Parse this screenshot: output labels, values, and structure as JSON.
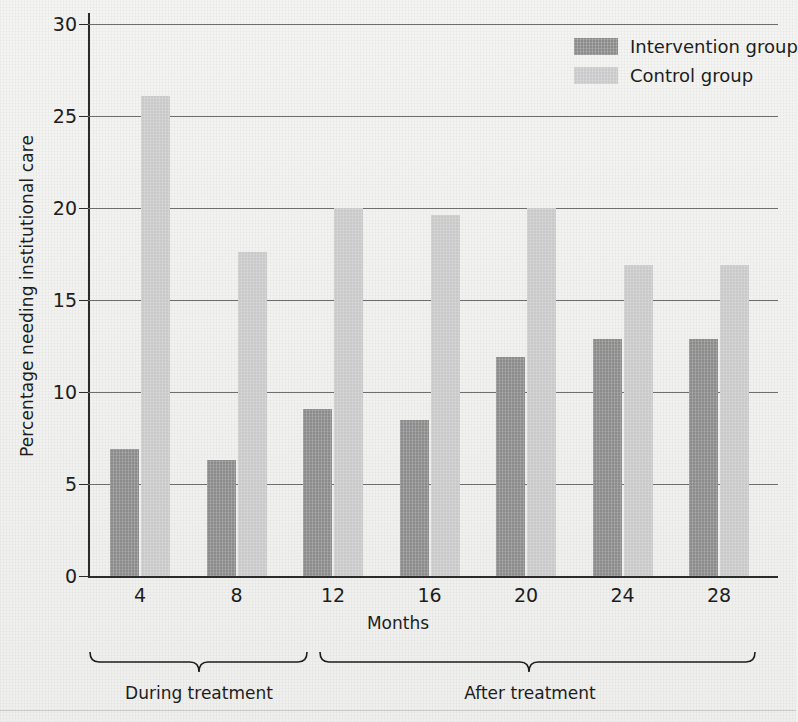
{
  "chart_data": {
    "type": "bar",
    "title": "",
    "xlabel": "Months",
    "ylabel": "Percentage needing institutional care",
    "categories": [
      "4",
      "8",
      "12",
      "16",
      "20",
      "24",
      "28"
    ],
    "ylim": [
      0,
      30
    ],
    "yticks": [
      0,
      5,
      10,
      15,
      20,
      25,
      30
    ],
    "grid": true,
    "legend_position": "top-right",
    "series": [
      {
        "name": "Intervention group",
        "color": "#8b8b8b",
        "values": [
          6.9,
          6.3,
          9.1,
          8.5,
          11.9,
          12.9,
          12.9
        ]
      },
      {
        "name": "Control group",
        "color": "#c9c9c9",
        "values": [
          26.1,
          17.6,
          20.0,
          19.6,
          20.0,
          16.9,
          16.9
        ]
      }
    ],
    "annotations": [
      {
        "label": "During treatment",
        "covers": [
          "4",
          "8",
          "12"
        ]
      },
      {
        "label": "After treatment",
        "covers": [
          "16",
          "20",
          "24",
          "28"
        ]
      }
    ]
  },
  "legend": {
    "items": [
      {
        "label": "Intervention group",
        "swatch": "intervention-swatch"
      },
      {
        "label": "Control group",
        "swatch": "control-swatch"
      }
    ]
  },
  "axes": {
    "y_title": "Percentage needing institutional care",
    "x_title": "Months",
    "y_ticks": [
      "30",
      "25",
      "20",
      "15",
      "10",
      "5",
      "0"
    ],
    "x_ticks": [
      "4",
      "8",
      "12",
      "16",
      "20",
      "24",
      "28"
    ]
  },
  "braces": {
    "during": "During treatment",
    "after": "After treatment"
  },
  "colors": {
    "intervention": "#8b8b8b",
    "control": "#c9c9c9",
    "axis": "#2b2b2b",
    "grid": "#6e6e6e",
    "background": "#f2f2f0"
  }
}
